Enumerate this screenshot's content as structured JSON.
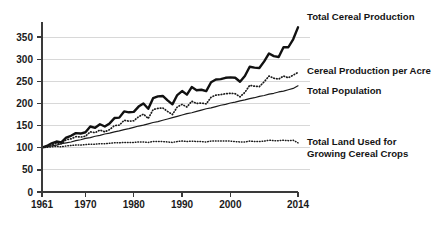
{
  "chart_data": {
    "type": "line",
    "title": "",
    "subtitle": "",
    "xlabel": "",
    "ylabel": "",
    "xlim": [
      1961,
      2014
    ],
    "ylim": [
      0,
      375
    ],
    "grid": true,
    "grid_axis": "y",
    "legend_position": "right-inline-annotations",
    "index_note": "All series indexed to 100 in 1961",
    "ytick_labels": [
      "0",
      "50",
      "100",
      "150",
      "200",
      "250",
      "300",
      "350"
    ],
    "ytick_values": [
      0,
      50,
      100,
      150,
      200,
      250,
      300,
      350
    ],
    "xtick_labels": [
      "1961",
      "1970",
      "1980",
      "1990",
      "2000",
      "2014"
    ],
    "xtick_values": [
      1961,
      1970,
      1980,
      1990,
      2000,
      2014
    ],
    "x": [
      1961,
      1962,
      1963,
      1964,
      1965,
      1966,
      1967,
      1968,
      1969,
      1970,
      1971,
      1972,
      1973,
      1974,
      1975,
      1976,
      1977,
      1978,
      1979,
      1980,
      1981,
      1982,
      1983,
      1984,
      1985,
      1986,
      1987,
      1988,
      1989,
      1990,
      1991,
      1992,
      1993,
      1994,
      1995,
      1996,
      1997,
      1998,
      1999,
      2000,
      2001,
      2002,
      2003,
      2004,
      2005,
      2006,
      2007,
      2008,
      2009,
      2010,
      2011,
      2012,
      2013,
      2014
    ],
    "series": [
      {
        "name": "Total Cereal Production",
        "style": "solid-bold",
        "label": "Total Cereal Production",
        "end_value": 372,
        "values": [
          100,
          104,
          110,
          114,
          112,
          123,
          127,
          133,
          132,
          135,
          148,
          145,
          153,
          148,
          155,
          167,
          168,
          182,
          180,
          181,
          193,
          200,
          188,
          212,
          216,
          217,
          207,
          198,
          219,
          228,
          220,
          237,
          230,
          231,
          228,
          248,
          254,
          255,
          258,
          259,
          258,
          249,
          262,
          283,
          281,
          280,
          295,
          313,
          307,
          305,
          327,
          327,
          345,
          372
        ]
      },
      {
        "name": "Cereal Production per Acre",
        "style": "dotted",
        "label": "Cereal Production per Acre",
        "end_value": 270,
        "values": [
          100,
          103,
          107,
          110,
          109,
          118,
          120,
          125,
          124,
          126,
          136,
          134,
          140,
          136,
          141,
          150,
          151,
          162,
          160,
          161,
          170,
          176,
          166,
          186,
          189,
          190,
          182,
          175,
          192,
          198,
          192,
          205,
          200,
          201,
          199,
          214,
          219,
          220,
          222,
          223,
          222,
          215,
          225,
          241,
          239,
          238,
          249,
          262,
          257,
          255,
          262,
          258,
          264,
          270
        ]
      },
      {
        "name": "Total Population",
        "style": "solid-thin",
        "label": "Total Population",
        "end_value": 240,
        "values": [
          100,
          102,
          104,
          106,
          109,
          111,
          113,
          116,
          118,
          121,
          123,
          126,
          128,
          131,
          133,
          136,
          138,
          141,
          143,
          146,
          149,
          151,
          154,
          157,
          159,
          162,
          165,
          168,
          171,
          174,
          177,
          179,
          182,
          185,
          188,
          190,
          193,
          196,
          198,
          201,
          203,
          206,
          208,
          211,
          213,
          216,
          218,
          221,
          223,
          226,
          228,
          231,
          234,
          240
        ]
      },
      {
        "name": "Total Land Used for Growing Cereal Crops",
        "style": "dotted-flat",
        "label_line1": "Total Land Used for",
        "label_line2": "Growing Cereal Crops",
        "end_value": 111,
        "values": [
          100,
          101,
          102,
          103,
          102,
          104,
          105,
          106,
          106,
          107,
          108,
          108,
          109,
          109,
          110,
          111,
          111,
          112,
          112,
          112,
          113,
          113,
          112,
          114,
          114,
          114,
          113,
          112,
          114,
          115,
          114,
          115,
          114,
          114,
          113,
          115,
          115,
          115,
          115,
          115,
          114,
          113,
          113,
          115,
          114,
          114,
          115,
          117,
          116,
          116,
          117,
          116,
          117,
          111
        ]
      }
    ]
  },
  "axis": {
    "y_axis_name": "index-axis",
    "x_axis_name": "year-axis"
  }
}
